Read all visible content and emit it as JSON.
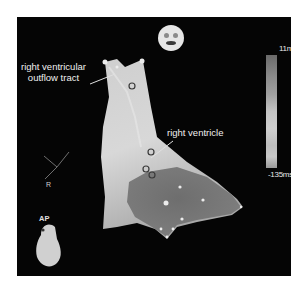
{
  "figure": {
    "type": "electroanatomic activation map",
    "background_color": "#050505"
  },
  "annotations": {
    "rvot_line1": "right ventricular",
    "rvot_line2": "outflow tract",
    "rv": "right ventricle"
  },
  "color_bar": {
    "max_label": "11ms",
    "min_label": "-135ms"
  },
  "orientation": {
    "axis_label": "R",
    "view_label": "AP",
    "face_icon": "face-orientation-icon"
  }
}
